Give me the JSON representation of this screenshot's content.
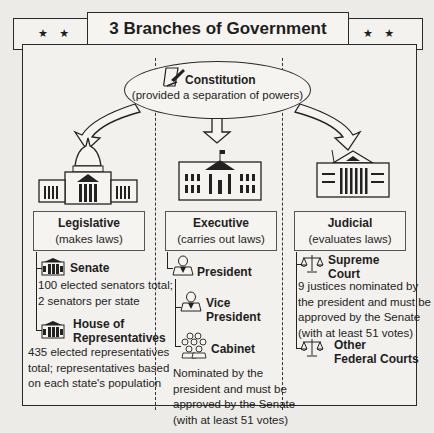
{
  "header": {
    "title": "3 Branches of Government",
    "stars_left": "★ ★",
    "stars_right": "★ ★"
  },
  "constitution": {
    "title": "Constitution",
    "subtitle": "(provided a separation of powers)",
    "icon": "scroll-quill-icon"
  },
  "branches": [
    {
      "name": "Legislative",
      "role": "(makes laws)",
      "icon": "capitol-building-icon",
      "items": [
        {
          "title": "Senate",
          "icon": "building-icon",
          "description": "100 elected senators total; 2 senators per state"
        },
        {
          "title": "House of Representatives",
          "title_lines": [
            "House of",
            "Representatives"
          ],
          "icon": "building-icon",
          "description": "435 elected representatives total; representatives based on each state's population"
        }
      ]
    },
    {
      "name": "Executive",
      "role": "(carries out laws)",
      "icon": "white-house-icon",
      "items": [
        {
          "title": "President",
          "icon": "person-icon"
        },
        {
          "title": "Vice President",
          "title_lines": [
            "Vice",
            "President"
          ],
          "icon": "person-icon"
        },
        {
          "title": "Cabinet",
          "icon": "group-icon",
          "description": "Nominated by the president and must be approved by the Senate (with at least 51 votes)"
        }
      ]
    },
    {
      "name": "Judicial",
      "role": "(evaluates laws)",
      "icon": "supreme-court-icon",
      "items": [
        {
          "title": "Supreme Court",
          "title_lines": [
            "Supreme",
            "Court"
          ],
          "icon": "scales-icon",
          "description": "9 justices nominated by the president and must be approved by the Senate (with at least 51 votes)"
        },
        {
          "title": "Other Federal Courts",
          "title_lines": [
            "Other",
            "Federal Courts"
          ],
          "icon": "scales-icon"
        }
      ]
    }
  ],
  "text": {
    "senate_desc_l1": "100 elected senators total;",
    "senate_desc_l2": "2 senators per state",
    "house_desc_l1": "435 elected representatives",
    "house_desc_l2": "total; representatives based",
    "house_desc_l3": "on each state's population",
    "cabinet_desc_l1": "Nominated by the",
    "cabinet_desc_l2": "president and must be",
    "cabinet_desc_l3": "approved by the Senate",
    "cabinet_desc_l4": "(with at least 51 votes)",
    "sc_desc_l1": "9 justices nominated by",
    "sc_desc_l2": "the president and must be",
    "sc_desc_l3": "approved by the Senate",
    "sc_desc_l4": "(with at least 51 votes)"
  }
}
